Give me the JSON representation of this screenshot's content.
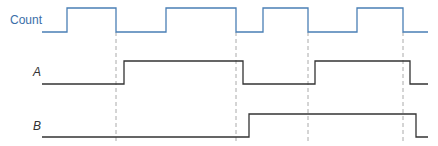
{
  "diagram": {
    "title": "",
    "signals": [
      {
        "name": "Count",
        "label_x": 10,
        "label_y": 13,
        "high_y": 8,
        "low_y": 32,
        "color": "#4a7fb5",
        "label_color": "#3a6ea8",
        "italic": false,
        "start_x": 42,
        "end_x": 428,
        "initial": 0,
        "transitions": [
          67,
          116,
          166,
          236,
          263,
          308,
          357,
          403
        ]
      },
      {
        "name": "A",
        "label_x": 33,
        "label_y": 65,
        "high_y": 61,
        "low_y": 84,
        "color": "#333333",
        "label_color": "#333333",
        "italic": true,
        "start_x": 42,
        "end_x": 428,
        "initial": 0,
        "transitions": [
          124,
          243,
          315,
          410
        ]
      },
      {
        "name": "B",
        "label_x": 33,
        "label_y": 119,
        "high_y": 114,
        "low_y": 137,
        "color": "#333333",
        "label_color": "#333333",
        "italic": true,
        "start_x": 42,
        "end_x": 428,
        "initial": 0,
        "transitions": [
          249,
          416
        ]
      }
    ],
    "dashed_guides": {
      "x": [
        116,
        236,
        308,
        403
      ],
      "y_top": 32,
      "y_bottom": 142,
      "color": "#aaaaaa"
    }
  }
}
